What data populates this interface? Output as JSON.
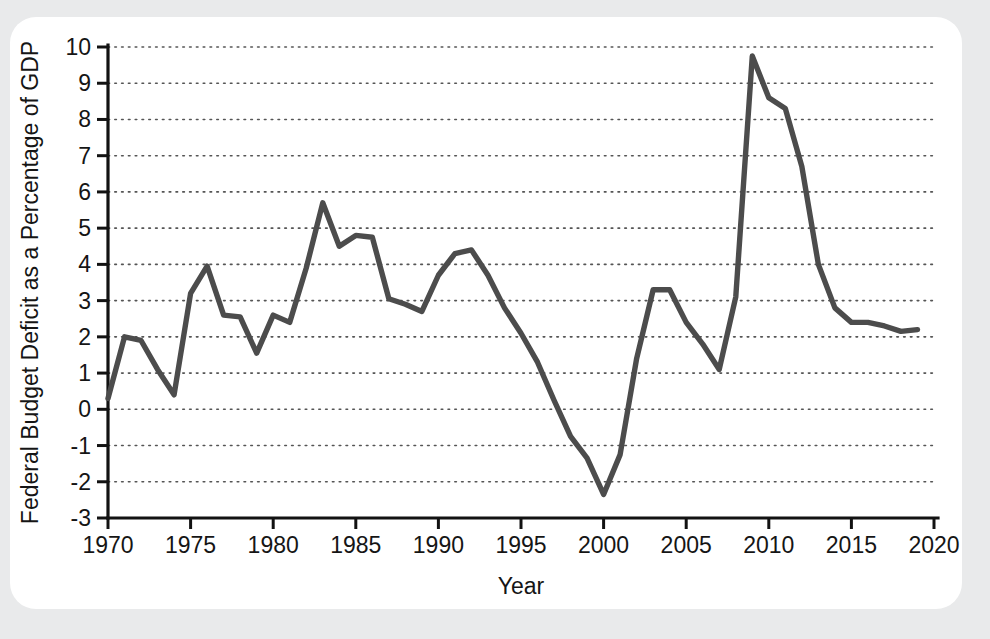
{
  "card": {
    "background_color": "#ffffff",
    "page_background_color": "#e9eaeb"
  },
  "chart_data": {
    "type": "line",
    "title": "",
    "xlabel": "Year",
    "ylabel": "Federal Budget Deficit as a Percentage of GDP",
    "xlim": [
      1970,
      2020
    ],
    "ylim": [
      -3,
      10
    ],
    "grid": true,
    "legend": "none",
    "line_color": "#4c4c4c",
    "x_tick_labels": [
      "1970",
      "1975",
      "1980",
      "1985",
      "1990",
      "1995",
      "2000",
      "2005",
      "2010",
      "2015",
      "2020"
    ],
    "x_ticks": [
      1970,
      1975,
      1980,
      1985,
      1990,
      1995,
      2000,
      2005,
      2010,
      2015,
      2020
    ],
    "y_tick_labels": [
      "-3",
      "-2",
      "-1",
      "0",
      "1",
      "2",
      "3",
      "4",
      "5",
      "6",
      "7",
      "8",
      "9",
      "10"
    ],
    "y_ticks": [
      -3,
      -2,
      -1,
      0,
      1,
      2,
      3,
      4,
      5,
      6,
      7,
      8,
      9,
      10
    ],
    "x": [
      1970,
      1971,
      1972,
      1973,
      1974,
      1975,
      1976,
      1977,
      1978,
      1979,
      1980,
      1981,
      1982,
      1983,
      1984,
      1985,
      1986,
      1987,
      1988,
      1989,
      1990,
      1991,
      1992,
      1993,
      1994,
      1995,
      1996,
      1997,
      1998,
      1999,
      2000,
      2001,
      2002,
      2003,
      2004,
      2005,
      2006,
      2007,
      2008,
      2009,
      2010,
      2011,
      2012,
      2013,
      2014,
      2015,
      2016,
      2017,
      2018,
      2019
    ],
    "values": [
      0.3,
      2.0,
      1.9,
      1.1,
      0.4,
      3.2,
      3.95,
      2.6,
      2.55,
      1.55,
      2.6,
      2.4,
      3.9,
      5.7,
      4.5,
      4.8,
      4.75,
      3.05,
      2.9,
      2.7,
      3.7,
      4.3,
      4.4,
      3.7,
      2.8,
      2.1,
      1.3,
      0.25,
      -0.75,
      -1.35,
      -2.35,
      -1.25,
      1.4,
      3.3,
      3.3,
      2.4,
      1.8,
      1.1,
      3.1,
      9.75,
      8.6,
      8.3,
      6.7,
      4.0,
      2.8,
      2.4,
      2.4,
      2.3,
      2.15,
      2.2
    ],
    "data_points_count": 50,
    "peak": {
      "year": 2009,
      "value": 9.75
    },
    "trough": {
      "year": 2000,
      "value": -2.35
    }
  }
}
